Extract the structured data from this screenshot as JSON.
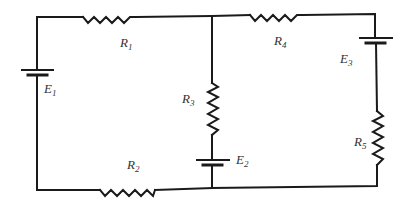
{
  "diagram": {
    "type": "circuit",
    "components": [
      {
        "id": "E1",
        "kind": "battery",
        "label": "E",
        "sub": "1"
      },
      {
        "id": "R1",
        "kind": "resistor",
        "label": "R",
        "sub": "1"
      },
      {
        "id": "R2",
        "kind": "resistor",
        "label": "R",
        "sub": "2"
      },
      {
        "id": "R3",
        "kind": "resistor",
        "label": "R",
        "sub": "3"
      },
      {
        "id": "E2",
        "kind": "battery",
        "label": "E",
        "sub": "2"
      },
      {
        "id": "R4",
        "kind": "resistor",
        "label": "R",
        "sub": "4"
      },
      {
        "id": "E3",
        "kind": "battery",
        "label": "E",
        "sub": "3"
      },
      {
        "id": "R5",
        "kind": "resistor",
        "label": "R",
        "sub": "5"
      }
    ],
    "colors": {
      "wire": "#1a1a1a",
      "label": "#333333",
      "background": "#ffffff"
    }
  }
}
